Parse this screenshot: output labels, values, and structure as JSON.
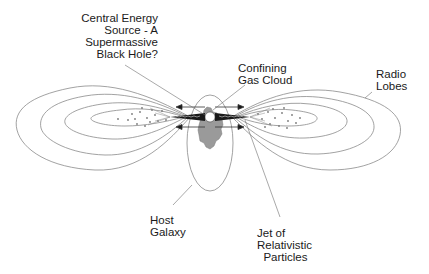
{
  "diagram": {
    "labels": {
      "energy_source": "Central Energy\nSource - A\nSupermassive\n  Black Hole?",
      "gas_cloud": "Confining\nGas Cloud",
      "radio_lobes": "Radio\nLobes",
      "host_galaxy": "Host\nGalaxy",
      "jet": "Jet of\nRelativistic\n  Particles"
    },
    "colors": {
      "line": "#8a8a8a",
      "leader": "#6e6e6e",
      "gas_cloud": "#9a9a9a",
      "jet": "#1a1a1a",
      "text": "#1a1a1a",
      "background": "#ffffff"
    },
    "components": [
      "black-hole",
      "confining-gas-cloud",
      "host-galaxy",
      "relativistic-jets",
      "radio-lobes"
    ]
  }
}
